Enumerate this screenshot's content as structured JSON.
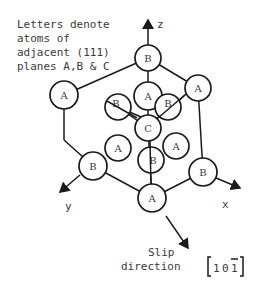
{
  "caption": {
    "lines": [
      "Letters denote",
      "atoms of",
      "adjacent (111)",
      "planes A,B & C"
    ]
  },
  "axes": {
    "z": "z",
    "x": "x",
    "y": "y"
  },
  "atoms": [
    {
      "id": "top",
      "label": "B",
      "cx": 148,
      "cy": 58,
      "r": 13
    },
    {
      "id": "upper-left",
      "label": "A",
      "cx": 64,
      "cy": 95,
      "r": 14
    },
    {
      "id": "upper-right",
      "label": "A",
      "cx": 198,
      "cy": 88,
      "r": 13
    },
    {
      "id": "inner-left",
      "label": "B",
      "cx": 118,
      "cy": 107,
      "r": 13
    },
    {
      "id": "inner-right",
      "label": "B",
      "cx": 168,
      "cy": 107,
      "r": 13
    },
    {
      "id": "inner-top",
      "label": "A",
      "cx": 148,
      "cy": 96,
      "r": 14
    },
    {
      "id": "center",
      "label": "C",
      "cx": 148,
      "cy": 128,
      "r": 13
    },
    {
      "id": "lower-left",
      "label": "A",
      "cx": 118,
      "cy": 148,
      "r": 13
    },
    {
      "id": "lower-center",
      "label": "B",
      "cx": 151,
      "cy": 160,
      "r": 13
    },
    {
      "id": "lower-right",
      "label": "A",
      "cx": 176,
      "cy": 146,
      "r": 13
    },
    {
      "id": "left",
      "label": "B",
      "cx": 93,
      "cy": 166,
      "r": 14
    },
    {
      "id": "right",
      "label": "B",
      "cx": 203,
      "cy": 172,
      "r": 14
    },
    {
      "id": "bottom",
      "label": "A",
      "cx": 152,
      "cy": 198,
      "r": 14
    }
  ],
  "slip": {
    "line1": "Slip",
    "line2": "direction",
    "miller": "1 0 1",
    "miller_digits": [
      "1",
      "0",
      "1"
    ],
    "bar_over_index": 2
  }
}
